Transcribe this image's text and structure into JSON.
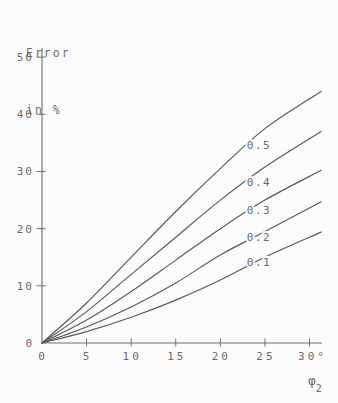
{
  "page": {
    "background": "#fcfcfc",
    "kind": "technical line chart, plotter-pen style"
  },
  "title": {
    "line1": "Error",
    "line2": "in %"
  },
  "chart_data": {
    "type": "line",
    "ylabel": "Error in %",
    "xlabel": "φ",
    "xlabel_subscript": "2",
    "x_unit": "degrees",
    "xlim": [
      0,
      31.4
    ],
    "ylim": [
      0,
      51.6
    ],
    "grid": false,
    "legend_position": "inline-curve-labels",
    "x_ticks": [
      0,
      5,
      10,
      15,
      20,
      25,
      30
    ],
    "x_tick_labels": [
      "0",
      "5",
      "10",
      "15",
      "20",
      "25",
      "30°"
    ],
    "y_ticks": [
      0,
      10,
      20,
      30,
      40,
      50
    ],
    "y_tick_labels": [
      "0",
      "10",
      "20",
      "30",
      "40",
      "50"
    ],
    "line_color": "#595959",
    "axis_color": "#6e6e6e",
    "text_color": "#6b6b6b",
    "series": [
      {
        "name": "0.5",
        "x": [
          0,
          5,
          10,
          15,
          20,
          25,
          31.3
        ],
        "y": [
          0,
          7,
          15,
          23,
          30.5,
          37.5,
          44
        ],
        "label_pos": {
          "x": 259,
          "y": 149
        }
      },
      {
        "name": "0.4",
        "x": [
          0,
          5,
          10,
          15,
          20,
          25,
          31.3
        ],
        "y": [
          0,
          5.5,
          12,
          18.5,
          25,
          30.8,
          37
        ],
        "label_pos": {
          "x": 259,
          "y": 186
        }
      },
      {
        "name": "0.3",
        "x": [
          0,
          5,
          10,
          15,
          20,
          25,
          31.3
        ],
        "y": [
          0,
          4,
          9,
          14.5,
          20,
          25,
          30.2
        ],
        "label_pos": {
          "x": 259,
          "y": 214
        }
      },
      {
        "name": "0.2",
        "x": [
          0,
          5,
          10,
          15,
          20,
          25,
          31.3
        ],
        "y": [
          0,
          2.8,
          6.3,
          10.5,
          15.4,
          19.5,
          24.7
        ],
        "label_pos": {
          "x": 259,
          "y": 241
        }
      },
      {
        "name": "0.1",
        "x": [
          0,
          5,
          10,
          15,
          20,
          25,
          31.3
        ],
        "y": [
          0,
          2,
          4.5,
          7.5,
          11,
          15,
          19.4
        ],
        "label_pos": {
          "x": 259,
          "y": 266
        }
      }
    ]
  }
}
